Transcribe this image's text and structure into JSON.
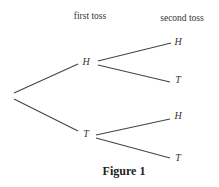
{
  "headers": {
    "first": "first toss",
    "second": "second toss"
  },
  "nodes": {
    "first_h": "H",
    "first_t": "T",
    "hh": "H",
    "ht": "T",
    "th": "H",
    "tt": "T"
  },
  "caption": "Figure 1",
  "colors": {
    "line": "#444444",
    "text": "#333333"
  }
}
